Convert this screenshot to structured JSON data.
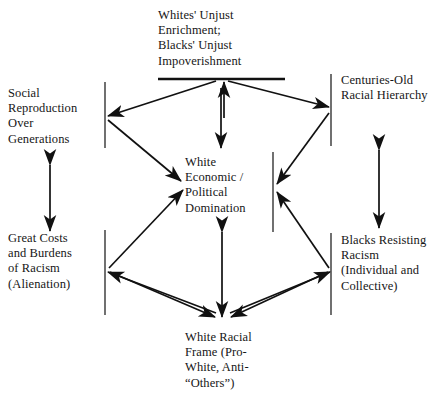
{
  "diagram": {
    "type": "cycle-diagram",
    "background_color": "#ffffff",
    "line_color": "#111111",
    "text_color": "#161616",
    "nodes": {
      "top": {
        "id": "whites-unjust-enrichment",
        "text": "Whites' Unjust\nEnrichment;\nBlacks' Unjust\nImpoverishment"
      },
      "upper_left": {
        "id": "social-reproduction",
        "text": "Social\nReproduction\nOver\nGenerations"
      },
      "upper_right": {
        "id": "centuries-old-racial-hierarchy",
        "text": "Centuries-Old\nRacial Hierarchy"
      },
      "center": {
        "id": "white-economic-political-domination",
        "text": "White\nEconomic /\nPolitical\nDomination"
      },
      "lower_left": {
        "id": "great-costs-burdens-racism",
        "text": "Great Costs\nand Burdens\nof Racism\n(Alienation)"
      },
      "lower_right": {
        "id": "blacks-resisting-racism",
        "text": "Blacks Resisting\nRacism\n(Individual and\nCollective)"
      },
      "bottom": {
        "id": "white-racial-frame",
        "text": "White Racial\nFrame (Pro-\nWhite, Anti-\n“Others”)"
      }
    },
    "connections": [
      {
        "from": "center",
        "to": "top",
        "style": "single-head"
      },
      {
        "from": "top",
        "to": "center",
        "style": "single-head"
      },
      {
        "from": "top",
        "to": "upper_left",
        "style": "single-head"
      },
      {
        "from": "top",
        "to": "upper_right",
        "style": "single-head"
      },
      {
        "from": "upper_left",
        "to": "center",
        "style": "single-head"
      },
      {
        "from": "upper_right",
        "to": "center",
        "style": "single-head"
      },
      {
        "from": "upper_left",
        "to": "lower_left",
        "style": "double-head"
      },
      {
        "from": "upper_right",
        "to": "lower_right",
        "style": "double-head"
      },
      {
        "from": "lower_left",
        "to": "center",
        "style": "single-head"
      },
      {
        "from": "lower_right",
        "to": "center",
        "style": "single-head"
      },
      {
        "from": "lower_left",
        "to": "bottom",
        "style": "single-head"
      },
      {
        "from": "lower_right",
        "to": "bottom",
        "style": "single-head"
      },
      {
        "from": "center",
        "to": "bottom",
        "style": "double-head"
      },
      {
        "from": "bottom",
        "to": "lower_left",
        "style": "single-head"
      },
      {
        "from": "bottom",
        "to": "lower_right",
        "style": "single-head"
      }
    ]
  }
}
